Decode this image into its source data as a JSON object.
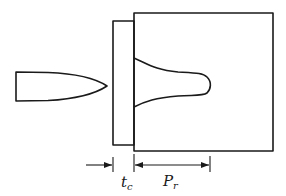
{
  "diagram": {
    "title": "",
    "elements": {
      "projectile": {
        "name": "projectile"
      },
      "cover_plate": {
        "name": "cover plate"
      },
      "target_block": {
        "name": "target block"
      },
      "penetration_crater": {
        "name": "penetration crater"
      }
    },
    "dimensions": {
      "cover_thickness": {
        "symbol": "t",
        "subscript": "c"
      },
      "residual_penetration": {
        "symbol": "P",
        "subscript": "r"
      }
    },
    "colors": {
      "line": "#1a1a1a",
      "background": "#ffffff"
    }
  }
}
